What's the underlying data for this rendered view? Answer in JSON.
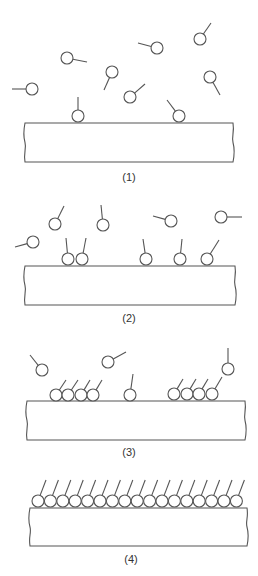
{
  "diagram": {
    "style": {
      "line_color": "#555555",
      "background": "#ffffff",
      "head_radius": 6
    },
    "panels": [
      {
        "label": "(1)",
        "label_pos": [
          129,
          181
        ],
        "substrate": {
          "x1": 25,
          "y1": 123,
          "x2": 233,
          "y2": 162
        },
        "molecules": [
          {
            "head": [
              32,
              89
            ],
            "tail": [
              12,
              89
            ]
          },
          {
            "head": [
              67,
              58
            ],
            "tail": [
              87,
              62
            ]
          },
          {
            "head": [
              112,
              72
            ],
            "tail": [
              104,
              90
            ]
          },
          {
            "head": [
              157,
              48
            ],
            "tail": [
              138,
              43
            ]
          },
          {
            "head": [
              200,
              39
            ],
            "tail": [
              211,
              23
            ]
          },
          {
            "head": [
              210,
              77
            ],
            "tail": [
              220,
              95
            ]
          },
          {
            "head": [
              130,
              97
            ],
            "tail": [
              145,
              84
            ]
          },
          {
            "head": [
              78,
              116
            ],
            "tail": [
              78,
              97
            ]
          },
          {
            "head": [
              179,
              116
            ],
            "tail": [
              167,
              100
            ]
          }
        ]
      },
      {
        "label": "(2)",
        "label_pos": [
          129,
          322
        ],
        "substrate": {
          "x1": 25,
          "y1": 266,
          "x2": 235,
          "y2": 305
        },
        "molecules": [
          {
            "head": [
              33,
              242
            ],
            "tail": [
              15,
              247
            ]
          },
          {
            "head": [
              55,
              224
            ],
            "tail": [
              64,
              206
            ]
          },
          {
            "head": [
              103,
              225
            ],
            "tail": [
              101,
              205
            ]
          },
          {
            "head": [
              171,
              221
            ],
            "tail": [
              153,
              216
            ]
          },
          {
            "head": [
              221,
              217
            ],
            "tail": [
              242,
              217
            ]
          },
          {
            "head": [
              68,
              259
            ],
            "tail": [
              66,
              238
            ]
          },
          {
            "head": [
              82,
              259
            ],
            "tail": [
              86,
              238
            ]
          },
          {
            "head": [
              146,
              259
            ],
            "tail": [
              143,
              239
            ]
          },
          {
            "head": [
              180,
              259
            ],
            "tail": [
              182,
              239
            ]
          },
          {
            "head": [
              207,
              259
            ],
            "tail": [
              219,
              240
            ]
          }
        ]
      },
      {
        "label": "(3)",
        "label_pos": [
          129,
          456
        ],
        "substrate": {
          "x1": 27,
          "y1": 401,
          "x2": 245,
          "y2": 440
        },
        "molecules": [
          {
            "head": [
              42,
              370
            ],
            "tail": [
              30,
              355
            ]
          },
          {
            "head": [
              108,
              362
            ],
            "tail": [
              126,
              352
            ]
          },
          {
            "head": [
              56,
              395
            ],
            "tail": [
              66,
              380
            ]
          },
          {
            "head": [
              68,
              395
            ],
            "tail": [
              78,
              380
            ]
          },
          {
            "head": [
              81,
              395
            ],
            "tail": [
              90,
              380
            ]
          },
          {
            "head": [
              93,
              395
            ],
            "tail": [
              102,
              380
            ]
          },
          {
            "head": [
              130,
              395
            ],
            "tail": [
              133,
              374
            ]
          },
          {
            "head": [
              174,
              394
            ],
            "tail": [
              183,
              379
            ]
          },
          {
            "head": [
              187,
              394
            ],
            "tail": [
              196,
              379
            ]
          },
          {
            "head": [
              199,
              394
            ],
            "tail": [
              208,
              379
            ]
          },
          {
            "head": [
              212,
              394
            ],
            "tail": [
              222,
              377
            ]
          },
          {
            "head": [
              228,
              369
            ],
            "tail": [
              228,
              348
            ]
          }
        ]
      },
      {
        "label": "(4)",
        "label_pos": [
          131,
          563
        ],
        "substrate": {
          "x1": 30,
          "y1": 508,
          "x2": 247,
          "y2": 546
        },
        "monolayer": {
          "count": 17,
          "start_x": 38,
          "spacing": 12.4,
          "y": 501,
          "tail_dx": 8,
          "tail_dy": -15
        }
      }
    ]
  }
}
